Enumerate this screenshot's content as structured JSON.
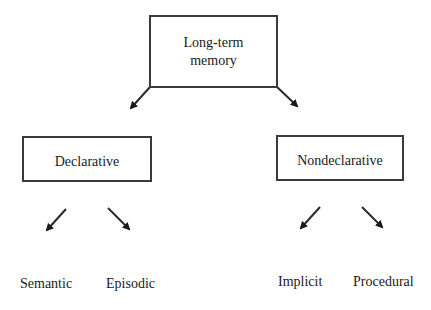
{
  "diagram": {
    "root": {
      "label": "Long-term\nmemory"
    },
    "branches": [
      {
        "label": "Declarative",
        "children": [
          "Semantic",
          "Episodic"
        ]
      },
      {
        "label": "Nondeclarative",
        "children": [
          "Implicit",
          "Procedural"
        ]
      }
    ],
    "colors": {
      "stroke": "#2a2a2a",
      "text": "#1a1a1a",
      "background": "#ffffff"
    }
  }
}
